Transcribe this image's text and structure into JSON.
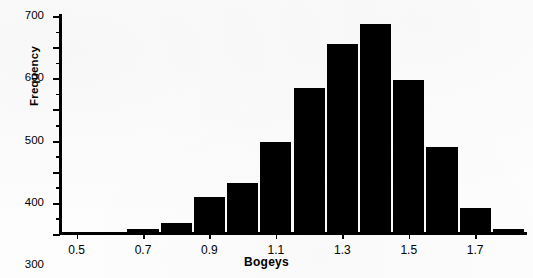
{
  "chart_data": {
    "type": "bar",
    "title": "",
    "xlabel": "Bogeys",
    "ylabel": "Frequency",
    "xlim": [
      0.45,
      1.85
    ],
    "ylim": [
      0,
      700
    ],
    "grid": false,
    "legend": null,
    "bin_width": 0.1,
    "x_tick_labels": [
      "0.5",
      "0.7",
      "0.9",
      "1.1",
      "1.3",
      "1.5",
      "1.7"
    ],
    "x_tick_values": [
      0.5,
      0.7,
      0.9,
      1.1,
      1.3,
      1.5,
      1.7
    ],
    "y_tick_labels": [
      "0",
      "100",
      "200",
      "300",
      "400",
      "500",
      "600",
      "700"
    ],
    "y_tick_values": [
      0,
      100,
      200,
      300,
      400,
      500,
      600,
      700
    ],
    "y_minor_tick_values": [
      50,
      150,
      250,
      350,
      450,
      550,
      650
    ],
    "bin_centers": [
      0.5,
      0.6,
      0.7,
      0.8,
      0.9,
      1.0,
      1.1,
      1.2,
      1.3,
      1.4,
      1.5,
      1.6,
      1.7,
      1.8
    ],
    "categories": [
      "0.5",
      "0.6",
      "0.7",
      "0.8",
      "0.9",
      "1.0",
      "1.1",
      "1.2",
      "1.3",
      "1.4",
      "1.5",
      "1.6",
      "1.7",
      "1.8"
    ],
    "values": [
      5,
      5,
      15,
      35,
      120,
      165,
      295,
      470,
      610,
      675,
      495,
      280,
      85,
      15
    ],
    "bar_color": "#000000",
    "background_color": "#ffffff"
  },
  "figure": {
    "axis_label_x": "Bogeys",
    "axis_label_y": "Frequency"
  }
}
